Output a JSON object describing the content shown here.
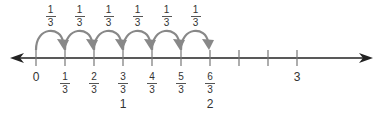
{
  "diagram": {
    "type": "number-line",
    "colors": {
      "axis": "#222222",
      "tick": "#777777",
      "arc": "#888888",
      "text": "#333333"
    },
    "axis": {
      "y": 58,
      "x_start": 10,
      "x_end": 373,
      "origin_x": 36,
      "unit_px": 29
    },
    "jump_labels": [
      {
        "num": "1",
        "den": "3"
      },
      {
        "num": "1",
        "den": "3"
      },
      {
        "num": "1",
        "den": "3"
      },
      {
        "num": "1",
        "den": "3"
      },
      {
        "num": "1",
        "den": "3"
      },
      {
        "num": "1",
        "den": "3"
      }
    ],
    "ticks": [
      {
        "index": 0,
        "label": "0"
      },
      {
        "index": 1,
        "num": "1",
        "den": "3"
      },
      {
        "index": 2,
        "num": "2",
        "den": "3"
      },
      {
        "index": 3,
        "num": "3",
        "den": "3",
        "whole": "1"
      },
      {
        "index": 4,
        "num": "4",
        "den": "3"
      },
      {
        "index": 5,
        "num": "5",
        "den": "3"
      },
      {
        "index": 6,
        "num": "6",
        "den": "3",
        "whole": "2"
      },
      {
        "index": 7
      },
      {
        "index": 8
      },
      {
        "index": 9,
        "label": "3"
      }
    ]
  }
}
